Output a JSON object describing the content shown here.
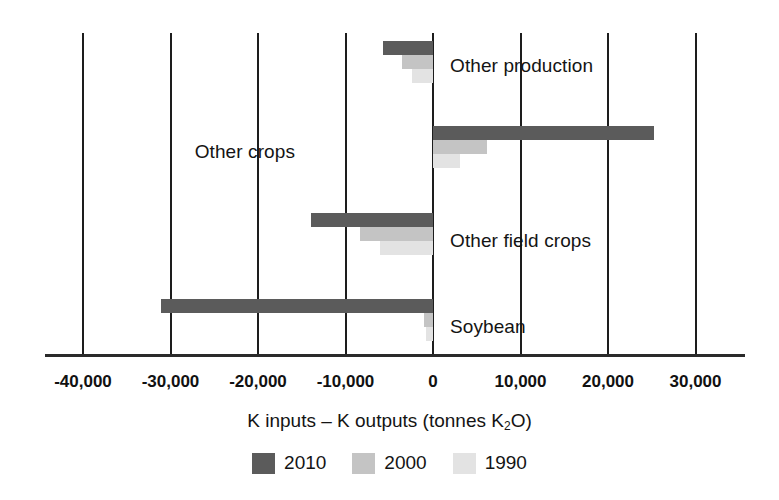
{
  "chart_data": {
    "type": "bar",
    "orientation": "horizontal",
    "title": "",
    "xlabel": "K inputs – K outputs (tonnes K2O)",
    "ylabel": "",
    "xlim": [
      -45000,
      35000
    ],
    "xticks": [
      -40000,
      -30000,
      -20000,
      -10000,
      0,
      10000,
      20000,
      30000
    ],
    "xticklabels": [
      "-40,000",
      "-30,000",
      "-20,000",
      "-10,000",
      "0",
      "10,000",
      "20,000",
      "30,000"
    ],
    "grid": true,
    "grid_axis": "x",
    "legend_position": "bottom",
    "categories": [
      "Other production",
      "Other crops",
      "Other field crops",
      "Soybean"
    ],
    "series": [
      {
        "name": "2010",
        "color": "#5b5b5b",
        "values": [
          -5700,
          25200,
          -13900,
          -31100
        ]
      },
      {
        "name": "2000",
        "color": "#c4c4c4",
        "values": [
          -3500,
          6200,
          -8400,
          -1000
        ]
      },
      {
        "name": "1990",
        "color": "#e3e3e3",
        "values": [
          -2400,
          3100,
          -6100,
          -800
        ]
      }
    ]
  },
  "axis": {
    "title_prefix": "K inputs – K outputs (tonnes K",
    "title_sub": "2",
    "title_suffix": "O)",
    "ticks": [
      {
        "value": -40000,
        "label": "-40,000"
      },
      {
        "value": -30000,
        "label": "-30,000"
      },
      {
        "value": -20000,
        "label": "-20,000"
      },
      {
        "value": -10000,
        "label": "-10,000"
      },
      {
        "value": 0,
        "label": "0"
      },
      {
        "value": 10000,
        "label": "10,000"
      },
      {
        "value": 20000,
        "label": "20,000"
      },
      {
        "value": 30000,
        "label": "30,000"
      }
    ]
  },
  "categories": [
    {
      "label": "Other production",
      "label_side": "right"
    },
    {
      "label": "Other crops",
      "label_side": "left"
    },
    {
      "label": "Other field crops",
      "label_side": "right"
    },
    {
      "label": "Soybean",
      "label_side": "right"
    }
  ],
  "legend": {
    "items": [
      {
        "label": "2010",
        "color": "#5b5b5b"
      },
      {
        "label": "2000",
        "color": "#c4c4c4"
      },
      {
        "label": "1990",
        "color": "#e3e3e3"
      }
    ]
  }
}
